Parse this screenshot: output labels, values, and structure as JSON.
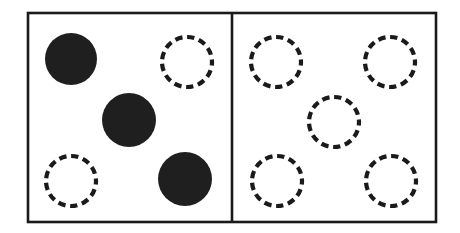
{
  "figure": {
    "background_color": "#ffffff",
    "stroke_color": "#1a1a1a",
    "fill_color": "#1f1f1f",
    "frame": {
      "name": "outer-rectangle",
      "x": 28,
      "y": 13,
      "width": 408,
      "height": 209,
      "stroke_width": 2.6
    },
    "divider": {
      "name": "vertical-divider",
      "x": 232,
      "y_top": 13,
      "y_bottom": 222,
      "stroke_width": 2.6
    },
    "panels": [
      {
        "id": "left-panel",
        "label": "left",
        "filled_count": 3,
        "dashed_count": 3
      },
      {
        "id": "right-panel",
        "label": "right",
        "filled_count": 0,
        "dashed_count": 5
      }
    ],
    "circles": [
      {
        "id": "left-filled-top-left",
        "panel": "left",
        "style": "filled",
        "cx": 71,
        "cy": 59,
        "r": 26
      },
      {
        "id": "left-filled-middle",
        "panel": "left",
        "style": "filled",
        "cx": 129,
        "cy": 120,
        "r": 27
      },
      {
        "id": "left-filled-bottom-right",
        "panel": "left",
        "style": "filled",
        "cx": 185,
        "cy": 179,
        "r": 27
      },
      {
        "id": "left-dashed-top-right",
        "panel": "left",
        "style": "dashed",
        "cx": 187,
        "cy": 62,
        "r": 25
      },
      {
        "id": "left-dashed-bottom-left",
        "panel": "left",
        "style": "dashed",
        "cx": 71,
        "cy": 181,
        "r": 25
      },
      {
        "id": "right-dashed-top-left",
        "panel": "right",
        "style": "dashed",
        "cx": 276,
        "cy": 62,
        "r": 25
      },
      {
        "id": "right-dashed-top-right",
        "panel": "right",
        "style": "dashed",
        "cx": 390,
        "cy": 62,
        "r": 25
      },
      {
        "id": "right-dashed-center",
        "panel": "right",
        "style": "dashed",
        "cx": 334,
        "cy": 122,
        "r": 25
      },
      {
        "id": "right-dashed-bottom-left",
        "panel": "right",
        "style": "dashed",
        "cx": 277,
        "cy": 181,
        "r": 25
      },
      {
        "id": "right-dashed-bottom-right",
        "panel": "right",
        "style": "dashed",
        "cx": 391,
        "cy": 181,
        "r": 25
      }
    ],
    "dash_pattern": {
      "dash_length": 7.2,
      "gap_length": 4.6,
      "stroke_width": 4.2
    }
  }
}
